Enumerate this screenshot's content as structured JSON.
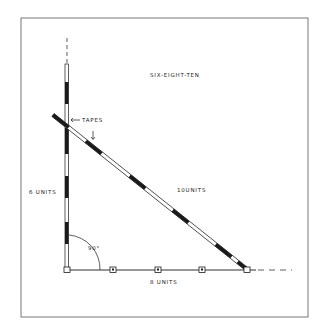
{
  "diagram": {
    "title": "SIX-EIGHT-TEN",
    "labels": {
      "tapes": "TAPES",
      "vertical_side": "6 UNITS",
      "hypotenuse": "10UNITS",
      "horizontal_side": "8 UNITS",
      "angle": "90°"
    },
    "colors": {
      "ink": "#1a1a1a",
      "background": "#ffffff",
      "frame": "#444444"
    }
  }
}
